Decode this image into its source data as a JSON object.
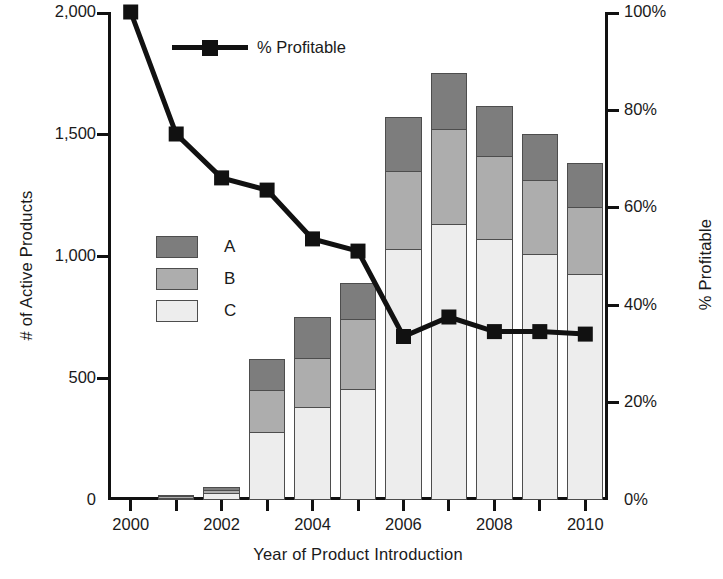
{
  "chart_data": {
    "type": "bar",
    "title": "",
    "subtitle": "",
    "xlabel": "Year of Product Introduction",
    "ylabel": "# of Active Products",
    "y2label": "% Profitable",
    "grid": false,
    "legend_position": "inside-upper-left",
    "ylim": [
      0,
      2000
    ],
    "y2lim": [
      0,
      100
    ],
    "yticks": [
      "0",
      "500",
      "1,000",
      "1,500",
      "2,000"
    ],
    "ytick_values": [
      0,
      500,
      1000,
      1500,
      2000
    ],
    "y2ticks": [
      "0%",
      "20%",
      "40%",
      "60%",
      "80%",
      "100%"
    ],
    "y2tick_values": [
      0,
      20,
      40,
      60,
      80,
      100
    ],
    "categories": [
      "2000",
      "2001",
      "2002",
      "2003",
      "2004",
      "2005",
      "2006",
      "2007",
      "2008",
      "2009",
      "2010"
    ],
    "xtick_labels": [
      "2000",
      "",
      "2002",
      "",
      "2004",
      "",
      "2006",
      "",
      "2008",
      "",
      "2010"
    ],
    "stacked": true,
    "series": [
      {
        "name": "C",
        "color": "#ededed",
        "values": [
          0,
          10,
          30,
          280,
          380,
          455,
          1030,
          1130,
          1070,
          1010,
          925
        ]
      },
      {
        "name": "B",
        "color": "#adadad",
        "values": [
          0,
          5,
          10,
          170,
          200,
          285,
          320,
          390,
          340,
          300,
          275
        ]
      },
      {
        "name": "A",
        "color": "#7d7d7d",
        "values": [
          0,
          5,
          15,
          130,
          170,
          150,
          220,
          230,
          205,
          190,
          180
        ]
      }
    ],
    "stack_totals": [
      0,
      20,
      55,
      580,
      750,
      890,
      1570,
      1750,
      1615,
      1500,
      1380
    ],
    "line_series": {
      "name": "% Profitable",
      "color": "#111111",
      "marker": "square",
      "axis": "right",
      "values": [
        100,
        75,
        66,
        63.5,
        53.5,
        51,
        33.5,
        37.5,
        34.5,
        34.5,
        34
      ]
    }
  },
  "legend": {
    "line_label": "% Profitable",
    "categories": [
      {
        "label": "A",
        "color": "#7d7d7d"
      },
      {
        "label": "B",
        "color": "#adadad"
      },
      {
        "label": "C",
        "color": "#ededed"
      }
    ]
  }
}
